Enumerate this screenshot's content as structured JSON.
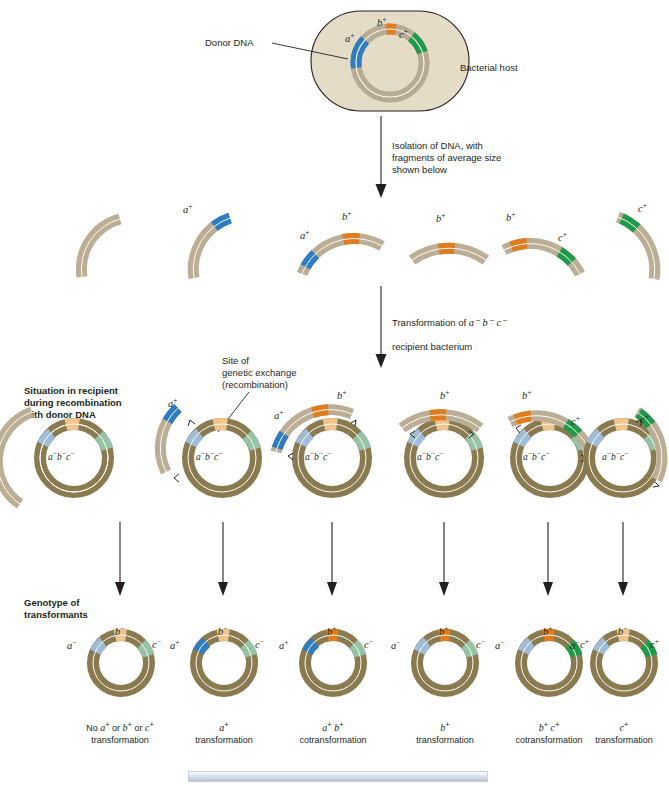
{
  "figure": {
    "title_hidden": "Bacterial transformation and cotransformation",
    "donor_dna_label": "Donor DNA",
    "bacterial_host_label": "Bacterial host",
    "step1_text": "Isolation of DNA, with\nfragments of average size\nshown below",
    "step2_text": "Transformation of a− b− c−\nrecipient bacterium",
    "step2_line1_pre": "Transformation of ",
    "step2_genes": "a⁻ b⁻ c⁻",
    "step2_line2": "recipient bacterium",
    "site_label": "Site of\ngenetic exchange\n(recombination)",
    "row_label_recombination": "Situation in recipient\nduring recombination\nwith donor DNA",
    "row_label_genotype": "Genotype of\ntransformants",
    "recipient_genotype": "a⁻b⁻c⁻"
  },
  "alleles": {
    "a_plus": "a",
    "b_plus": "b",
    "c_plus": "c",
    "plus": "+",
    "minus": "−"
  },
  "colors": {
    "host_fill": "#e5dcc8",
    "host_stroke": "#231f20",
    "donor_chromosome": "#b8ab93",
    "recipient_chromosome": "#8a7a4f",
    "fragment_strand": "#bbae95",
    "a_plus_color": "#2e7cc1",
    "b_plus_color": "#e07b1e",
    "c_plus_color": "#1f9a4a",
    "a_minus_color": "#9fbcd9",
    "b_minus_color": "#f0c48c",
    "c_minus_color": "#96c3a5",
    "arrow_color": "#231f20",
    "inner_line": "#fdfcf7",
    "bottom_bar": "#ccd6e2"
  },
  "donor_circle": {
    "markers": [
      {
        "name": "a-plus",
        "gene": "a",
        "state": "+"
      },
      {
        "name": "b-plus",
        "gene": "b",
        "state": "+"
      },
      {
        "name": "c-plus",
        "gene": "c",
        "state": "+"
      }
    ]
  },
  "fragments_row": {
    "label": "DNA fragments of average size",
    "items": [
      {
        "id": "frag-1",
        "markers": [],
        "labels": []
      },
      {
        "id": "frag-2",
        "markers": [
          "a+"
        ],
        "labels": [
          "a+"
        ]
      },
      {
        "id": "frag-3",
        "markers": [
          "a+",
          "b+"
        ],
        "labels": [
          "a+",
          "b+"
        ]
      },
      {
        "id": "frag-4",
        "markers": [
          "b+"
        ],
        "labels": [
          "b+"
        ]
      },
      {
        "id": "frag-5",
        "markers": [
          "b+",
          "c+"
        ],
        "labels": [
          "b+",
          "c+"
        ]
      },
      {
        "id": "frag-6",
        "markers": [
          "c+"
        ],
        "labels": [
          "c+"
        ]
      }
    ]
  },
  "recombination_row": {
    "items": [
      {
        "id": "recomb-1",
        "fragment_markers": [],
        "labels": []
      },
      {
        "id": "recomb-2",
        "fragment_markers": [
          "a+"
        ],
        "labels": [
          "a+"
        ]
      },
      {
        "id": "recomb-3",
        "fragment_markers": [
          "a+",
          "b+"
        ],
        "labels": [
          "a+",
          "b+"
        ]
      },
      {
        "id": "recomb-4",
        "fragment_markers": [
          "b+"
        ],
        "labels": [
          "b+"
        ]
      },
      {
        "id": "recomb-5",
        "fragment_markers": [
          "b+",
          "c+"
        ],
        "labels": [
          "b+",
          "c+"
        ]
      },
      {
        "id": "recomb-6",
        "fragment_markers": [
          "c+"
        ],
        "labels": [
          "c+"
        ]
      }
    ]
  },
  "genotype_row": {
    "items": [
      {
        "id": "geno-1",
        "a": "−",
        "b": "−",
        "c": "−",
        "label_a": "a⁻",
        "label_b": "b⁻",
        "label_c": "c⁻",
        "caption_line1": "No a+ or b+ or c+",
        "caption_line2": "transformation"
      },
      {
        "id": "geno-2",
        "a": "+",
        "b": "−",
        "c": "−",
        "label_a": "a⁺",
        "label_b": "b⁻",
        "label_c": "c⁻",
        "caption_line1": "a+",
        "caption_line2": "transformation"
      },
      {
        "id": "geno-3",
        "a": "+",
        "b": "+",
        "c": "−",
        "label_a": "a⁺",
        "label_b": "b⁺",
        "label_c": "c⁻",
        "caption_line1": "a+ b+",
        "caption_line2": "cotransformation"
      },
      {
        "id": "geno-4",
        "a": "−",
        "b": "+",
        "c": "−",
        "label_a": "a⁻",
        "label_b": "b⁺",
        "label_c": "c⁻",
        "caption_line1": "b+",
        "caption_line2": "transformation"
      },
      {
        "id": "geno-5",
        "a": "−",
        "b": "+",
        "c": "+",
        "label_a": "a⁻",
        "label_b": "b⁺",
        "label_c": "c⁺",
        "caption_line1": "b+ c+",
        "caption_line2": "cotransformation"
      },
      {
        "id": "geno-6",
        "a": "−",
        "b": "−",
        "c": "+",
        "label_a": "a⁻",
        "label_b": "b⁻",
        "label_c": "c⁺",
        "caption_line1": "c+",
        "caption_line2": "transformation"
      }
    ]
  }
}
